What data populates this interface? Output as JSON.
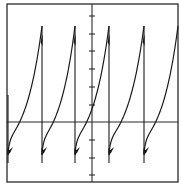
{
  "chart_data": {
    "type": "line",
    "title": "",
    "xlabel": "",
    "ylabel": "",
    "grid": false,
    "legend": null,
    "axes": {
      "x_divisions_visible": false,
      "y_tick_count_above_axis": 6,
      "y_tick_count_below_axis": 3,
      "ylim": [
        -3.4,
        6.6
      ],
      "xlim": [
        -5,
        5
      ]
    },
    "period_divisions": 1.9,
    "cycles_visible": 5,
    "peak_value": 5.3,
    "trough_value": -1.7,
    "drop_minimum": -2.2,
    "peaks_x": [
      -2.9,
      -1.0,
      0.9,
      2.9,
      4.9
    ],
    "zero_crossings_x": [
      -3.9,
      -1.9,
      0.0,
      1.9,
      3.9
    ],
    "colors": {
      "trace": "#1a1a1a",
      "axes": "#2a2a2a",
      "background": "#ffffff"
    }
  },
  "pixel_geometry": {
    "frame": {
      "left": 7,
      "top": 4,
      "right": 178,
      "bottom": 182
    },
    "axis_x_y": 122,
    "axis_y_x": 92,
    "y_ticks_px": [
      16,
      34,
      51,
      69,
      87,
      105,
      140,
      158,
      175
    ],
    "drops_x": [
      8,
      42,
      75,
      109,
      144
    ],
    "peak_y": 26,
    "drop_bottom_y": 163,
    "knee_y": 152,
    "last_peak_x": 178
  }
}
